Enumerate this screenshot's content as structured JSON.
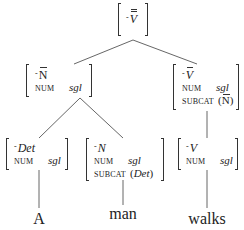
{
  "diagram": {
    "type": "syntax-tree",
    "nodes": {
      "root": {
        "category": "V",
        "bar_level": 2,
        "marker": "-"
      },
      "np": {
        "category": "N",
        "bar_level": 1,
        "marker": "-",
        "features": [
          {
            "attr": "NUM",
            "value": "sgl"
          }
        ]
      },
      "vp": {
        "category": "V",
        "bar_level": 1,
        "marker": "-",
        "features": [
          {
            "attr": "NUM",
            "value": "sgl"
          },
          {
            "attr": "SUBCAT",
            "value_open": "(",
            "value": "N",
            "value_close": ")"
          }
        ]
      },
      "det": {
        "category": "Det",
        "bar_level": 0,
        "marker": "-",
        "features": [
          {
            "attr": "NUM",
            "value": "sgl"
          }
        ]
      },
      "n": {
        "category": "N",
        "bar_level": 0,
        "marker": "-",
        "features": [
          {
            "attr": "NUM",
            "value": "sgl"
          },
          {
            "attr": "SUBCAT",
            "value_open": "(",
            "value": "Det",
            "value_close": ")"
          }
        ]
      },
      "v": {
        "category": "V",
        "bar_level": 0,
        "marker": "-",
        "features": [
          {
            "attr": "NUM",
            "value": "sgl"
          }
        ]
      }
    },
    "words": {
      "w1": "A",
      "w2": "man",
      "w3": "walks"
    },
    "edges": [
      [
        "root",
        "np"
      ],
      [
        "root",
        "vp"
      ],
      [
        "np",
        "det"
      ],
      [
        "np",
        "n"
      ],
      [
        "vp",
        "v"
      ],
      [
        "det",
        "w1"
      ],
      [
        "n",
        "w2"
      ],
      [
        "v",
        "w3"
      ]
    ]
  }
}
